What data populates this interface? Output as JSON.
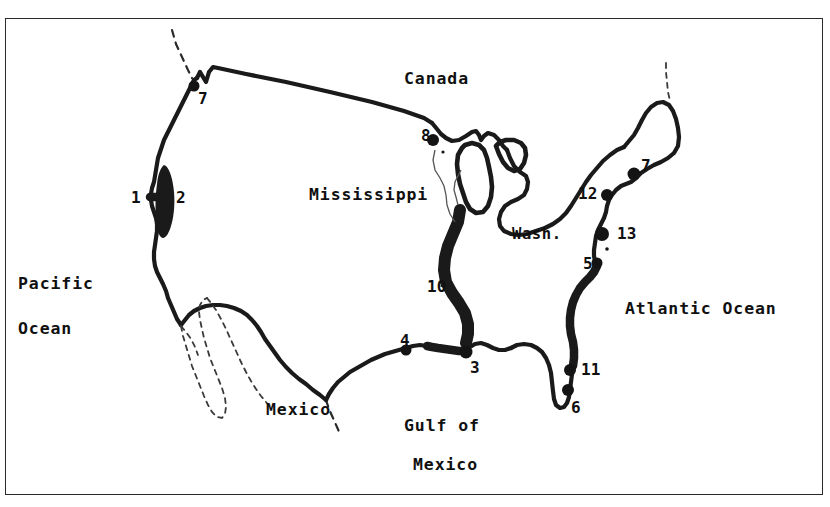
{
  "figure": {
    "type": "line-drawing-map",
    "title": "",
    "region": "Contiguous United States",
    "border_color": "#2a2a2a",
    "ink_color": "#1a1a1a",
    "background": "#ffffff"
  },
  "ocean_labels": [
    {
      "id": "pacific-line1",
      "text": "Pacific",
      "x": 18,
      "y": 285
    },
    {
      "id": "pacific-line2",
      "text": "Ocean",
      "x": 18,
      "y": 330
    },
    {
      "id": "atlantic",
      "text": "Atlantic Ocean",
      "x": 625,
      "y": 310
    }
  ],
  "region_labels": [
    {
      "id": "canada",
      "text": "Canada",
      "x": 404,
      "y": 80
    },
    {
      "id": "mississippi",
      "text": "Mississippi",
      "x": 309,
      "y": 196
    },
    {
      "id": "mexico",
      "text": "Mexico",
      "x": 266,
      "y": 411
    },
    {
      "id": "gulf-line1",
      "text": "Gulf of",
      "x": 404,
      "y": 427
    },
    {
      "id": "gulf-line2",
      "text": "Mexico",
      "x": 413,
      "y": 466
    }
  ],
  "city_labels": [
    {
      "id": "washington",
      "text": "Wash.",
      "x": 512,
      "y": 227
    }
  ],
  "site_numbers": [
    {
      "id": "site-1",
      "text": "1",
      "x": 131,
      "y": 190
    },
    {
      "id": "site-2",
      "text": "2",
      "x": 176,
      "y": 190
    },
    {
      "id": "site-7-nw",
      "text": "7",
      "x": 198,
      "y": 91
    },
    {
      "id": "site-8",
      "text": "8",
      "x": 421,
      "y": 128
    },
    {
      "id": "site-10",
      "text": "10",
      "x": 427,
      "y": 279
    },
    {
      "id": "site-4",
      "text": "4",
      "x": 400,
      "y": 333
    },
    {
      "id": "site-3",
      "text": "3",
      "x": 470,
      "y": 360
    },
    {
      "id": "site-11",
      "text": "11",
      "x": 581,
      "y": 362
    },
    {
      "id": "site-6",
      "text": "6",
      "x": 571,
      "y": 400
    },
    {
      "id": "site-5",
      "text": "5",
      "x": 583,
      "y": 256
    },
    {
      "id": "site-12",
      "text": "12",
      "x": 578,
      "y": 186
    },
    {
      "id": "site-13",
      "text": "13",
      "x": 617,
      "y": 226
    },
    {
      "id": "site-7-ne",
      "text": "7",
      "x": 641,
      "y": 158
    }
  ],
  "site_markers": [
    {
      "id": "marker-7-nw",
      "x": 194,
      "y": 86,
      "r": 5.5
    },
    {
      "id": "marker-8",
      "x": 433,
      "y": 140,
      "r": 6.0
    },
    {
      "id": "marker-4",
      "x": 406,
      "y": 350,
      "r": 5.5
    },
    {
      "id": "marker-3",
      "x": 466,
      "y": 352,
      "r": 6.5
    },
    {
      "id": "marker-11",
      "x": 570,
      "y": 370,
      "r": 6.0
    },
    {
      "id": "marker-6",
      "x": 568,
      "y": 390,
      "r": 6.0
    },
    {
      "id": "marker-5",
      "x": 597,
      "y": 263,
      "r": 5.5
    },
    {
      "id": "marker-12",
      "x": 607,
      "y": 195,
      "r": 6.0
    },
    {
      "id": "marker-13",
      "x": 602,
      "y": 234,
      "r": 7.0
    },
    {
      "id": "marker-7-ne",
      "x": 634,
      "y": 174,
      "r": 6.5
    }
  ],
  "legend_note": ""
}
